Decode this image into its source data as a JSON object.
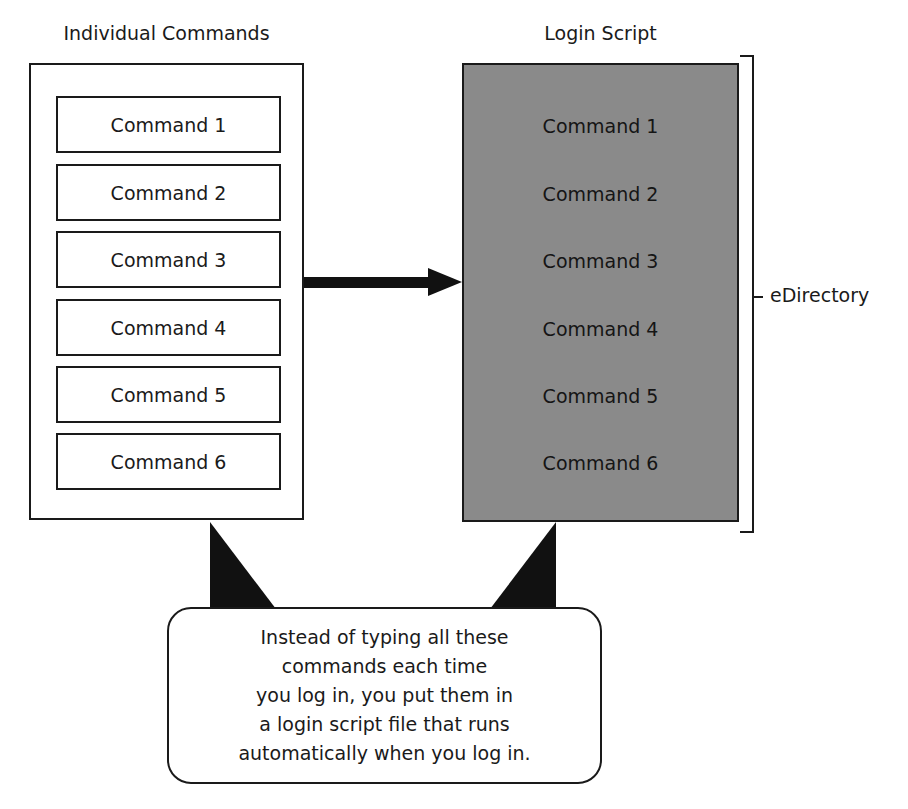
{
  "diagram": {
    "left": {
      "title": "Individual Commands",
      "commands": [
        "Command 1",
        "Command 2",
        "Command 3",
        "Command 4",
        "Command 5",
        "Command 6"
      ]
    },
    "right": {
      "title": "Login Script",
      "fill_color": "#8a8a8a",
      "commands": [
        "Command 1",
        "Command 2",
        "Command 3",
        "Command 4",
        "Command 5",
        "Command 6"
      ]
    },
    "bracket_label": "eDirectory",
    "callout": {
      "lines": [
        "Instead of typing all these",
        "commands each time",
        "you log in, you put them in",
        "a login script file that runs",
        "automatically when you log in."
      ]
    }
  }
}
